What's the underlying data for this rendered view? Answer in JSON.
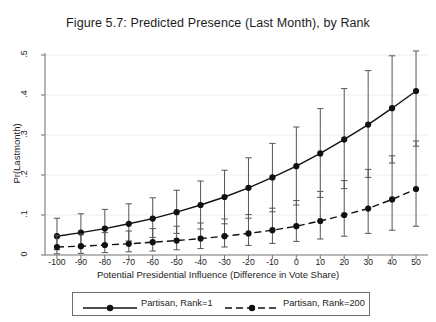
{
  "chart_data": {
    "type": "line",
    "title": "Figure 5.7: Predicted Presence (Last Month), by Rank",
    "xlabel": "Potential Presidential Influence (Difference in Vote Share)",
    "ylabel": "Pr(Lastmonth)",
    "x": [
      -100,
      -90,
      -80,
      -70,
      -60,
      -50,
      -40,
      -30,
      -20,
      -10,
      0,
      10,
      20,
      30,
      40,
      50
    ],
    "xlim": [
      -105,
      55
    ],
    "ylim": [
      0,
      0.5
    ],
    "xticklabels": [
      "-100",
      "-90",
      "-80",
      "-70",
      "-60",
      "-50",
      "-40",
      "-30",
      "-20",
      "-10",
      "0",
      "10",
      "20",
      "30",
      "40",
      "50"
    ],
    "yticklabels": [
      "0",
      ".1",
      ".2",
      ".3",
      ".4",
      ".5"
    ],
    "yticks": [
      0,
      0.1,
      0.2,
      0.3,
      0.4,
      0.5
    ],
    "grid": true,
    "legend_position": "below",
    "series": [
      {
        "name": "Partisan, Rank=1",
        "style": "solid",
        "marker": "filled-circle",
        "values": [
          0.047,
          0.056,
          0.066,
          0.078,
          0.091,
          0.107,
          0.125,
          0.145,
          0.168,
          0.194,
          0.222,
          0.254,
          0.289,
          0.326,
          0.367,
          0.41
        ],
        "ci_low": [
          0.013,
          0.02,
          0.027,
          0.035,
          0.044,
          0.054,
          0.065,
          0.078,
          0.092,
          0.108,
          0.125,
          0.144,
          0.166,
          0.194,
          0.23,
          0.272
        ],
        "ci_high": [
          0.092,
          0.103,
          0.114,
          0.128,
          0.143,
          0.162,
          0.185,
          0.212,
          0.243,
          0.279,
          0.32,
          0.366,
          0.416,
          0.461,
          0.498,
          0.54
        ]
      },
      {
        "name": "Partisan, Rank=200",
        "style": "dashed",
        "marker": "filled-circle",
        "values": [
          0.02,
          0.022,
          0.025,
          0.028,
          0.032,
          0.036,
          0.041,
          0.047,
          0.054,
          0.062,
          0.072,
          0.085,
          0.1,
          0.116,
          0.139,
          0.165
        ],
        "ci_low": [
          0.003,
          0.004,
          0.006,
          0.008,
          0.01,
          0.013,
          0.016,
          0.02,
          0.024,
          0.029,
          0.034,
          0.04,
          0.047,
          0.054,
          0.062,
          0.072
        ],
        "ci_high": [
          0.049,
          0.052,
          0.056,
          0.06,
          0.066,
          0.072,
          0.08,
          0.09,
          0.101,
          0.117,
          0.136,
          0.159,
          0.186,
          0.214,
          0.248,
          0.285
        ]
      }
    ]
  },
  "legend": {
    "items": [
      {
        "label": "Partisan, Rank=1"
      },
      {
        "label": "Partisan, Rank=200"
      }
    ]
  }
}
